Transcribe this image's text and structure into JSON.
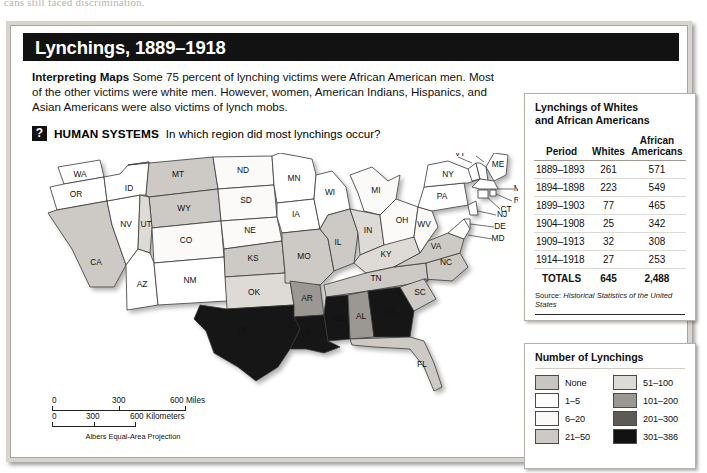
{
  "bleed": {
    "text": "cans still faced discrimination."
  },
  "figure": {
    "title": "Lynchings, 1889–1918",
    "intro_label": "Interpreting Maps",
    "intro_text": "Some 75 percent of lynching victims were African American men. Most of the other victims were white men. However, women, American Indians, Hispanics, and Asian Americans were also victims of lynch mobs.",
    "question_icon": "?",
    "question_label": "HUMAN SYSTEMS",
    "question_text": "In which region did most lynchings occur?"
  },
  "stats": {
    "title_line1": "Lynchings of Whites",
    "title_line2": "and African Americans",
    "columns": [
      "Period",
      "Whites",
      "African Americans"
    ],
    "col_african_line1": "African",
    "col_african_line2": "Americans",
    "rows": [
      {
        "period": "1889–1893",
        "whites": "261",
        "african": "571"
      },
      {
        "period": "1894–1898",
        "whites": "223",
        "african": "549"
      },
      {
        "period": "1899–1903",
        "whites": "77",
        "african": "465"
      },
      {
        "period": "1904–1908",
        "whites": "25",
        "african": "342"
      },
      {
        "period": "1909–1913",
        "whites": "32",
        "african": "308"
      },
      {
        "period": "1914–1918",
        "whites": "27",
        "african": "253"
      }
    ],
    "totals": {
      "period": "TOTALS",
      "whites": "645",
      "african": "2,488"
    },
    "source_label": "Source:",
    "source_text": "Historical Statistics of the United States"
  },
  "legend": {
    "title": "Number of Lynchings",
    "items": [
      {
        "label": "None",
        "color": "#c9c6c1"
      },
      {
        "label": "51–100",
        "color": "#dedbd6"
      },
      {
        "label": "1–5",
        "color": "#ffffff"
      },
      {
        "label": "101–200",
        "color": "#9b9792"
      },
      {
        "label": "6–20",
        "color": "#fbfaf8"
      },
      {
        "label": "201–300",
        "color": "#5d5a57"
      },
      {
        "label": "21–50",
        "color": "#cdcac5"
      },
      {
        "label": "301–386",
        "color": "#121212"
      }
    ]
  },
  "map": {
    "projection": "Albers Equal-Area Projection",
    "scale_miles": {
      "ticks": [
        "0",
        "300",
        "600 Miles"
      ]
    },
    "scale_km": {
      "ticks": [
        "0",
        "300",
        "600 Kilometers"
      ]
    },
    "states": [
      {
        "code": "WA",
        "fill": "#ffffff"
      },
      {
        "code": "OR",
        "fill": "#ffffff"
      },
      {
        "code": "CA",
        "fill": "#cdcac5"
      },
      {
        "code": "NV",
        "fill": "#ffffff"
      },
      {
        "code": "ID",
        "fill": "#ffffff"
      },
      {
        "code": "MT",
        "fill": "#cdcac5"
      },
      {
        "code": "WY",
        "fill": "#cdcac5"
      },
      {
        "code": "UT",
        "fill": "#dedbd6"
      },
      {
        "code": "CO",
        "fill": "#fbfaf8"
      },
      {
        "code": "AZ",
        "fill": "#ffffff"
      },
      {
        "code": "NM",
        "fill": "#ffffff"
      },
      {
        "code": "ND",
        "fill": "#fbfaf8"
      },
      {
        "code": "SD",
        "fill": "#fbfaf8"
      },
      {
        "code": "NE",
        "fill": "#fbfaf8"
      },
      {
        "code": "KS",
        "fill": "#cdcac5"
      },
      {
        "code": "OK",
        "fill": "#dedbd6"
      },
      {
        "code": "TX",
        "fill": "#121212"
      },
      {
        "code": "MN",
        "fill": "#ffffff"
      },
      {
        "code": "IA",
        "fill": "#ffffff"
      },
      {
        "code": "MO",
        "fill": "#cdcac5"
      },
      {
        "code": "AR",
        "fill": "#9b9792"
      },
      {
        "code": "LA",
        "fill": "#121212"
      },
      {
        "code": "WI",
        "fill": "#ffffff"
      },
      {
        "code": "IL",
        "fill": "#cdcac5"
      },
      {
        "code": "MI",
        "fill": "#fbfaf8"
      },
      {
        "code": "IN",
        "fill": "#dedbd6"
      },
      {
        "code": "OH",
        "fill": "#fbfaf8"
      },
      {
        "code": "KY",
        "fill": "#dedbd6"
      },
      {
        "code": "TN",
        "fill": "#cdcac5"
      },
      {
        "code": "MS",
        "fill": "#121212"
      },
      {
        "code": "AL",
        "fill": "#9b9792"
      },
      {
        "code": "GA",
        "fill": "#121212"
      },
      {
        "code": "FL",
        "fill": "#cdcac5"
      },
      {
        "code": "SC",
        "fill": "#cdcac5"
      },
      {
        "code": "NC",
        "fill": "#cdcac5"
      },
      {
        "code": "VA",
        "fill": "#cdcac5"
      },
      {
        "code": "WV",
        "fill": "#fbfaf8"
      },
      {
        "code": "PA",
        "fill": "#ffffff"
      },
      {
        "code": "NY",
        "fill": "#ffffff"
      },
      {
        "code": "ME",
        "fill": "#ffffff"
      },
      {
        "code": "VT",
        "fill": "#ffffff"
      },
      {
        "code": "NH",
        "fill": "#ffffff"
      },
      {
        "code": "MA",
        "fill": "#ffffff"
      },
      {
        "code": "RI",
        "fill": "#ffffff"
      },
      {
        "code": "CT",
        "fill": "#ffffff"
      },
      {
        "code": "NJ",
        "fill": "#ffffff"
      },
      {
        "code": "DE",
        "fill": "#ffffff"
      },
      {
        "code": "MD",
        "fill": "#ffffff"
      }
    ]
  }
}
